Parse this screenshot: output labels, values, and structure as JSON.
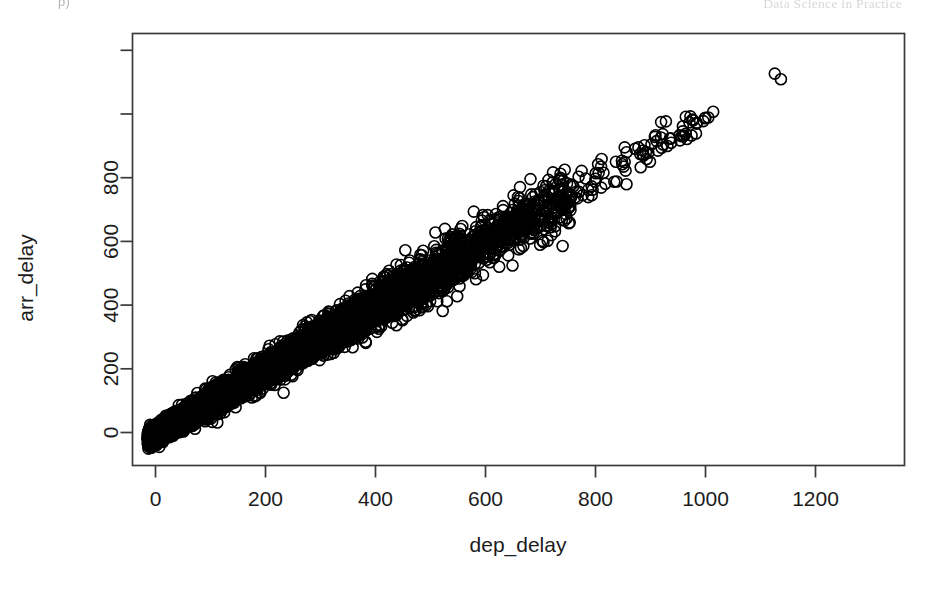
{
  "page_header": {
    "left_text": "p)",
    "right_text": "Data Science in Practice"
  },
  "figure": {
    "name": "scatterplot-dep-delay-vs-arr-delay"
  },
  "chart_data": {
    "type": "scatter",
    "title": "",
    "xlabel": "dep_delay",
    "ylabel": "arr_delay",
    "xlim": [
      -40,
      1340
    ],
    "ylim": [
      -120,
      1300
    ],
    "grid": false,
    "legend": null,
    "marker": {
      "shape": "open-circle",
      "size_px": 11,
      "stroke": "#000000",
      "stroke_width": 1.6,
      "fill": "none"
    },
    "axes": {
      "x_ticks": [
        0,
        200,
        400,
        600,
        800,
        1000,
        1200
      ],
      "x_tick_labels": [
        "0",
        "200",
        "400",
        "600",
        "800",
        "1000",
        "1200"
      ],
      "y_ticks": [
        0,
        200,
        400,
        600,
        800,
        1000,
        1200
      ],
      "y_tick_labels": [
        "0",
        "200",
        "400",
        "600",
        "800",
        "",
        "",
        "1200"
      ],
      "y_tick_labels_shown": [
        "0",
        "200",
        "400",
        "600",
        "800",
        "1200"
      ],
      "box": true
    },
    "relationship": {
      "slope": 1.0,
      "intercept": -5,
      "correlation": 0.92
    },
    "notable_points": [
      {
        "x": 1301,
        "y": 1272,
        "label": "maximum delay outlier"
      },
      {
        "x": 1126,
        "y": 1127
      },
      {
        "x": 1137,
        "y": 1109
      },
      {
        "x": 1014,
        "y": 1007
      },
      {
        "x": 1005,
        "y": 989
      },
      {
        "x": 960,
        "y": 931
      },
      {
        "x": 911,
        "y": 915
      },
      {
        "x": 899,
        "y": 850
      },
      {
        "x": 878,
        "y": 895
      },
      {
        "x": 853,
        "y": 849
      },
      {
        "x": 848,
        "y": 853
      },
      {
        "x": 896,
        "y": 878
      },
      {
        "x": 853,
        "y": 895
      },
      {
        "x": 818,
        "y": 781
      },
      {
        "x": 793,
        "y": 745
      },
      {
        "x": 765,
        "y": 756
      },
      {
        "x": 701,
        "y": 686
      },
      {
        "x": 653,
        "y": 632
      },
      {
        "x": 627,
        "y": 677
      },
      {
        "x": 583,
        "y": 645
      },
      {
        "x": 593,
        "y": 597
      },
      {
        "x": 233,
        "y": 125
      }
    ],
    "n_points_approx": 327000
  }
}
